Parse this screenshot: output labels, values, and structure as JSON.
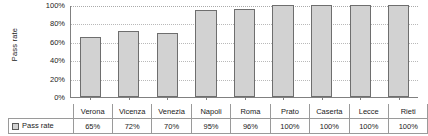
{
  "chart_data": {
    "type": "bar",
    "title": "",
    "xlabel": "",
    "ylabel": "Pass rate",
    "ylim": [
      0,
      100
    ],
    "grid": true,
    "legend_position": "table-row",
    "categories": [
      "Verona",
      "Vicenza",
      "Venezia",
      "Napoli",
      "Roma",
      "Prato",
      "Caserta",
      "Lecce",
      "Rieti"
    ],
    "series": [
      {
        "name": "Pass rate",
        "values": [
          65,
          72,
          70,
          95,
          96,
          100,
          100,
          100,
          100
        ],
        "value_labels": [
          "65%",
          "72%",
          "70%",
          "95%",
          "96%",
          "100%",
          "100%",
          "100%",
          "100%"
        ],
        "color": "#d2d2d2",
        "border_color": "#6e6e6e"
      }
    ],
    "y_ticks": [
      {
        "value": 100,
        "label": "100%"
      },
      {
        "value": 80,
        "label": "80%"
      },
      {
        "value": 60,
        "label": "60%"
      },
      {
        "value": 40,
        "label": "40%"
      },
      {
        "value": 20,
        "label": "20%"
      },
      {
        "value": 0,
        "label": "0%"
      }
    ]
  },
  "axis": {
    "y_title": "Pass rate"
  },
  "legend": {
    "label": "Pass rate",
    "swatch_color": "#d2d2d2"
  }
}
